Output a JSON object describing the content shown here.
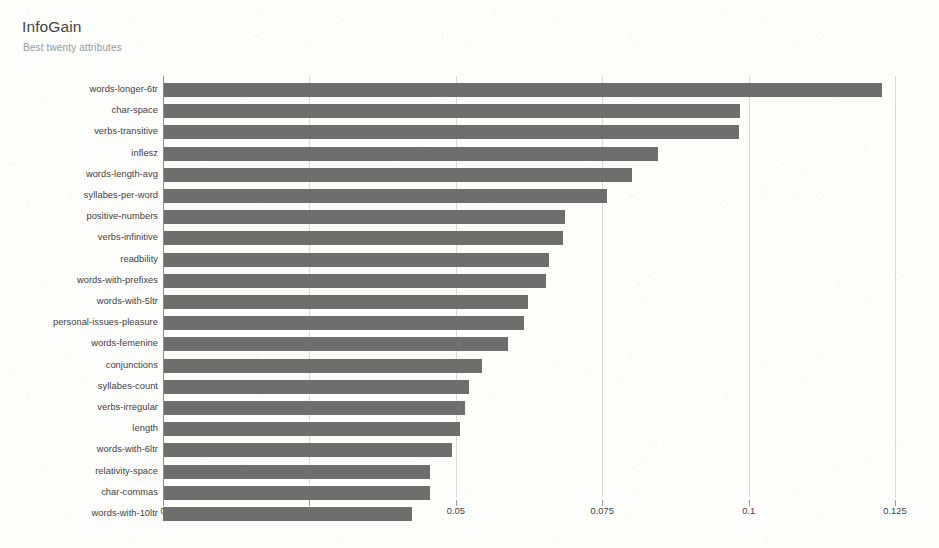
{
  "chart_data": {
    "type": "bar",
    "orientation": "horizontal",
    "title": "InfoGain",
    "subtitle": "Best twenty attributes",
    "xlabel": "",
    "ylabel": "",
    "xlim": [
      0,
      0.13
    ],
    "grid": "vertical",
    "legend": "none",
    "bar_color": "#6e6e6e",
    "gridline_color": "#d8d8d8",
    "axis_color": "#8d8d8d",
    "xticks": [
      "0",
      "0.025",
      "0.05",
      "0.075",
      "0.1",
      "0.125"
    ],
    "xtick_values": [
      0,
      0.025,
      0.05,
      0.075,
      0.1,
      0.125
    ],
    "categories": [
      "words-longer-6tr",
      "char-space",
      "verbs-transitive",
      "inflesz",
      "words-length-avg",
      "syllabes-per-word",
      "positive-numbers",
      "verbs-infinitive",
      "readbility",
      "words-with-prefixes",
      "words-with-5ltr",
      "personal-issues-pleasure",
      "words-femenine",
      "conjunctions",
      "syllabes-count",
      "verbs-irregular",
      "length",
      "words-with-6ltr",
      "relativity-space",
      "char-commas",
      "words-with-10ltr"
    ],
    "values": [
      0.1228,
      0.0985,
      0.0984,
      0.0845,
      0.0801,
      0.0758,
      0.0686,
      0.0683,
      0.0659,
      0.0654,
      0.0623,
      0.0617,
      0.0589,
      0.0545,
      0.0523,
      0.0516,
      0.0507,
      0.0493,
      0.0456,
      0.0456,
      0.0425
    ]
  }
}
